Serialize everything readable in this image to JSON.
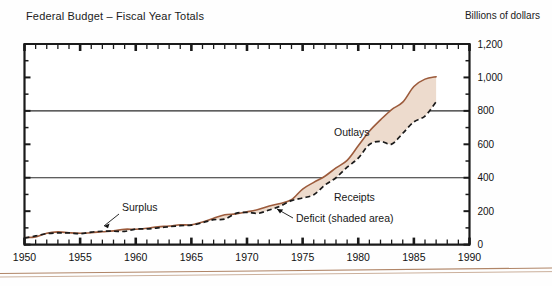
{
  "figure": {
    "title": "Federal Budget – Fiscal Year Totals",
    "units_label": "Billions of dollars",
    "bottom_rule": "decorative-double-rule"
  },
  "chart_data": {
    "type": "area",
    "title": "Federal Budget – Fiscal Year Totals",
    "subtitle": "",
    "xlabel": "",
    "ylabel": "Billions of dollars",
    "xlim": [
      1950,
      1990
    ],
    "ylim": [
      0,
      1200
    ],
    "xticks": [
      1950,
      1955,
      1960,
      1965,
      1970,
      1975,
      1980,
      1985,
      1990
    ],
    "xtick_labels": [
      "1950",
      "1955",
      "1960",
      "1965",
      "1970",
      "1975",
      "1980",
      "1985",
      "1990"
    ],
    "yticks": [
      0,
      200,
      400,
      600,
      800,
      1000,
      1200
    ],
    "ytick_labels": [
      "0",
      "200",
      "400",
      "600",
      "800",
      "1,000",
      "1,200"
    ],
    "minor_xtick_interval": 1,
    "minor_ytick_interval": 100,
    "grid": "horizontal gridlines at 400 and 800",
    "gridlines": [
      400,
      800
    ],
    "legend": "inline annotations",
    "x": [
      1950,
      1951,
      1952,
      1953,
      1954,
      1955,
      1956,
      1957,
      1958,
      1959,
      1960,
      1961,
      1962,
      1963,
      1964,
      1965,
      1966,
      1967,
      1968,
      1969,
      1970,
      1971,
      1972,
      1973,
      1974,
      1975,
      1976,
      1977,
      1978,
      1979,
      1980,
      1981,
      1982,
      1983,
      1984,
      1985,
      1986,
      1987
    ],
    "series": [
      {
        "name": "Outlays",
        "style": "solid brown line",
        "color": "#9c5b3c",
        "values": [
          42,
          45,
          68,
          76,
          71,
          68,
          71,
          77,
          82,
          92,
          92,
          98,
          107,
          111,
          119,
          118,
          135,
          158,
          178,
          184,
          196,
          210,
          231,
          246,
          269,
          332,
          372,
          409,
          459,
          504,
          591,
          678,
          746,
          808,
          852,
          946,
          990,
          1004
        ]
      },
      {
        "name": "Receipts",
        "style": "black dashed line",
        "color": "#1a1a1a",
        "values": [
          39,
          52,
          66,
          70,
          70,
          65,
          75,
          80,
          80,
          79,
          93,
          94,
          100,
          107,
          113,
          117,
          131,
          149,
          153,
          187,
          193,
          187,
          207,
          231,
          263,
          279,
          298,
          356,
          400,
          463,
          517,
          599,
          618,
          601,
          666,
          734,
          769,
          854
        ]
      }
    ],
    "shaded_region": {
      "name": "Deficit (shaded area)",
      "description": "area between Outlays and Receipts shaded light tan",
      "color": "#eddbcd"
    },
    "annotations": [
      {
        "text": "Surplus",
        "x": 1958,
        "y": 150,
        "has_leader": true
      },
      {
        "text": "Outlays",
        "x": 1977.5,
        "y": 520,
        "has_leader": false
      },
      {
        "text": "Receipts",
        "x": 1979.5,
        "y": 250,
        "has_leader": false
      },
      {
        "text": "Deficit (shaded area)",
        "x": 1980,
        "y": 150,
        "has_leader": true
      }
    ]
  },
  "axis": {
    "y_labels": [
      "1,200",
      "1,000",
      "800",
      "600",
      "400",
      "200",
      "0"
    ],
    "x_labels": [
      "1950",
      "1955",
      "1960",
      "1965",
      "1970",
      "1975",
      "1980",
      "1985",
      "1990"
    ]
  },
  "annotations": {
    "surplus": "Surplus",
    "outlays": "Outlays",
    "receipts": "Receipts",
    "deficit": "Deficit (shaded area)"
  },
  "colors": {
    "outlays_line": "#9c5b3c",
    "receipts_line": "#1a1a1a",
    "deficit_fill": "#eddbcd",
    "axis": "#1a1a1a",
    "rule": "#b08567"
  }
}
